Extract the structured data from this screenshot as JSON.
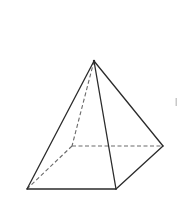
{
  "diagram": {
    "type": "square-pyramid",
    "colors": {
      "background": "#ffffff",
      "visible_edge": "#2b2b2b",
      "hidden_edge": "#6a6a6a"
    },
    "vertices": {
      "apex": [
        94,
        61
      ],
      "front_left": [
        27,
        189
      ],
      "front_right": [
        116,
        189
      ],
      "back_right": [
        163,
        146
      ],
      "back_left": [
        72,
        146
      ]
    },
    "visible_edges": [
      [
        "apex",
        "front_left"
      ],
      [
        "apex",
        "front_right"
      ],
      [
        "apex",
        "back_right"
      ],
      [
        "front_left",
        "front_right"
      ],
      [
        "front_right",
        "back_right"
      ]
    ],
    "hidden_edges": [
      [
        "apex",
        "back_left"
      ],
      [
        "back_left",
        "front_left"
      ],
      [
        "back_left",
        "back_right"
      ]
    ]
  }
}
